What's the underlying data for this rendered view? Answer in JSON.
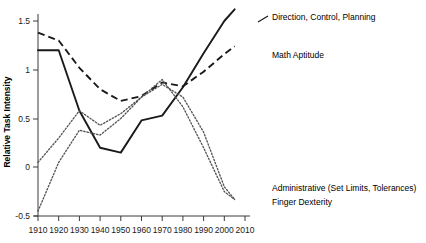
{
  "chart_data": {
    "type": "line",
    "title": "",
    "xlabel": "",
    "ylabel": "Relative Task Intensity",
    "xlim": [
      1910,
      2010
    ],
    "ylim": [
      -0.5,
      1.5
    ],
    "grid": false,
    "legend_position": "inline-right-annotations",
    "x_ticks": [
      "1910",
      "1920",
      "1930",
      "1940",
      "1950",
      "1960",
      "1970",
      "1980",
      "1990",
      "2000",
      "2010"
    ],
    "y_ticks": [
      "-0.5",
      "0",
      "0.5",
      "1",
      "1.5"
    ],
    "x": [
      1910,
      1920,
      1930,
      1940,
      1950,
      1960,
      1970,
      1980,
      1990,
      2000,
      2005
    ],
    "series": [
      {
        "name": "Direction, Control, Planning",
        "style": "solid",
        "label": "Direction, Control, Planning",
        "values": [
          1.2,
          1.2,
          0.58,
          0.2,
          0.15,
          0.48,
          0.53,
          0.82,
          1.17,
          1.5,
          1.62
        ]
      },
      {
        "name": "Math Aptitude",
        "style": "dashed",
        "label": "Math Aptitude",
        "values": [
          1.38,
          1.3,
          1.02,
          0.8,
          0.68,
          0.73,
          0.87,
          0.83,
          0.98,
          1.16,
          1.24
        ]
      },
      {
        "name": "Administrative (Set Limits, Tolerances)",
        "style": "dotted",
        "label": "Administrative (Set Limits, Tolerances)",
        "values": [
          0.05,
          0.3,
          0.58,
          0.43,
          0.55,
          0.72,
          0.9,
          0.62,
          0.2,
          -0.25,
          -0.33
        ]
      },
      {
        "name": "Finger Dexterity",
        "style": "dotted",
        "label": "Finger Dexterity",
        "values": [
          -0.45,
          0.05,
          0.38,
          0.33,
          0.5,
          0.72,
          0.85,
          0.72,
          0.36,
          -0.2,
          -0.33
        ]
      }
    ],
    "annotations": [
      {
        "text": "Direction, Control, Planning",
        "series": "Direction, Control, Planning"
      },
      {
        "text": "Math Aptitude",
        "series": "Math Aptitude"
      },
      {
        "text": "Administrative (Set Limits, Tolerances)",
        "series": "Administrative (Set Limits, Tolerances)"
      },
      {
        "text": "Finger Dexterity",
        "series": "Finger Dexterity"
      }
    ]
  }
}
